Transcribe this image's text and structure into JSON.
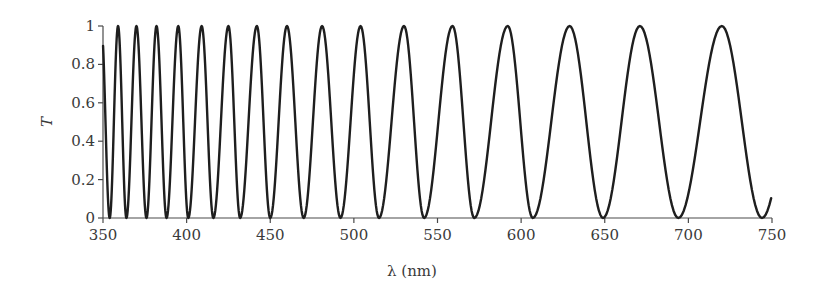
{
  "chart_data": {
    "type": "line",
    "title": "",
    "xlabel": "λ (nm)",
    "ylabel": "T",
    "xlim": [
      350,
      750
    ],
    "ylim": [
      0,
      1
    ],
    "grid": false,
    "legend": null,
    "x_ticks": [
      350,
      400,
      450,
      500,
      550,
      600,
      650,
      700,
      750
    ],
    "x_tick_labels": [
      "350",
      "400",
      "450",
      "500",
      "550",
      "600",
      "650",
      "700",
      "750"
    ],
    "y_ticks": [
      0,
      0.2,
      0.4,
      0.6,
      0.8,
      1
    ],
    "y_tick_labels": [
      "0",
      "0.2",
      "0.4",
      "0.6",
      "0.8",
      "1"
    ],
    "series": [
      {
        "name": "Transmittance",
        "color": "#1e1e1e",
        "start": {
          "x": 350,
          "y": 0.78
        },
        "end": {
          "x": 750,
          "y": 0.07
        },
        "maxima_x": [
          359,
          370,
          382,
          395,
          409,
          425,
          442,
          460,
          481,
          504,
          530,
          559,
          592,
          629,
          671,
          720
        ],
        "maxima_y": 1.0,
        "minima_x": [
          354,
          364,
          376,
          388,
          401,
          416,
          432,
          450,
          470,
          492,
          515,
          542,
          572,
          607,
          649,
          694,
          744
        ],
        "minima_y": 0.0
      }
    ]
  },
  "plot_area": {
    "x0_px": 103,
    "x1_px": 772,
    "y0_px": 218,
    "y1_px": 26
  }
}
